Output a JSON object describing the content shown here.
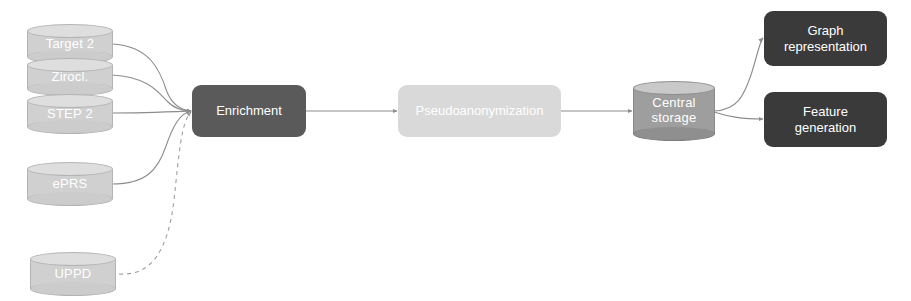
{
  "diagram": {
    "colors": {
      "source_cylinder": "#d0d0d0",
      "storage_cylinder": "#9e9e9e",
      "process_dark": "#5a5a5a",
      "process_light": "#d9d9d9",
      "output_box": "#3a3a3a",
      "edge": "#8c8c8c",
      "background": "#ffffff"
    },
    "sources": [
      {
        "id": "target2",
        "label": "Target 2",
        "shape": "cylinder"
      },
      {
        "id": "zirocl",
        "label": "Zirocl.",
        "shape": "cylinder"
      },
      {
        "id": "step2",
        "label": "STEP 2",
        "shape": "cylinder"
      },
      {
        "id": "eprs",
        "label": "ePRS",
        "shape": "cylinder"
      },
      {
        "id": "uppd",
        "label": "UPPD",
        "shape": "cylinder"
      }
    ],
    "processes": [
      {
        "id": "enrichment",
        "label": "Enrichment",
        "shape": "rounded-rect",
        "style": "dark"
      },
      {
        "id": "pseudoanonymization",
        "label": "Pseudoanonymization",
        "shape": "rounded-rect",
        "style": "light"
      }
    ],
    "storage": {
      "id": "central_storage",
      "line1": "Central",
      "line2": "storage",
      "shape": "cylinder"
    },
    "outputs": [
      {
        "id": "graph_representation",
        "line1": "Graph",
        "line2": "representation",
        "shape": "rounded-rect",
        "style": "darker"
      },
      {
        "id": "feature_generation",
        "line1": "Feature",
        "line2": "generation",
        "shape": "rounded-rect",
        "style": "darker"
      }
    ],
    "edges": [
      {
        "from": "target2",
        "to": "enrichment",
        "style": "solid",
        "arrow": true
      },
      {
        "from": "zirocl",
        "to": "enrichment",
        "style": "solid",
        "arrow": true
      },
      {
        "from": "step2",
        "to": "enrichment",
        "style": "solid",
        "arrow": true
      },
      {
        "from": "eprs",
        "to": "enrichment",
        "style": "solid",
        "arrow": true
      },
      {
        "from": "uppd",
        "to": "enrichment",
        "style": "dashed",
        "arrow": true
      },
      {
        "from": "enrichment",
        "to": "pseudoanonymization",
        "style": "solid",
        "arrow": true
      },
      {
        "from": "pseudoanonymization",
        "to": "central_storage",
        "style": "solid",
        "arrow": true
      },
      {
        "from": "central_storage",
        "to": "graph_representation",
        "style": "solid",
        "arrow": true
      },
      {
        "from": "central_storage",
        "to": "feature_generation",
        "style": "solid",
        "arrow": true
      }
    ]
  }
}
